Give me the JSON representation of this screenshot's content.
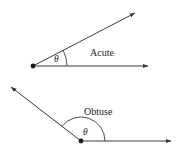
{
  "diagram": {
    "panels": [
      {
        "name": "acute",
        "label": "Acute",
        "angle_symbol": "θ",
        "vertex": [
          33,
          66
        ],
        "ray_horizontal_end": [
          148,
          66
        ],
        "ray_angled_end": [
          135,
          13
        ],
        "approx_angle_deg": 27
      },
      {
        "name": "obtuse",
        "label": "Obtuse",
        "angle_symbol": "θ",
        "vertex": [
          81,
          141
        ],
        "ray_horizontal_end": [
          171,
          141
        ],
        "ray_angled_end": [
          11,
          87
        ],
        "approx_angle_deg": 143
      }
    ],
    "colors": {
      "line": "#3a3a3a",
      "vertex": "#1a1a1a",
      "background": "#ffffff"
    }
  }
}
